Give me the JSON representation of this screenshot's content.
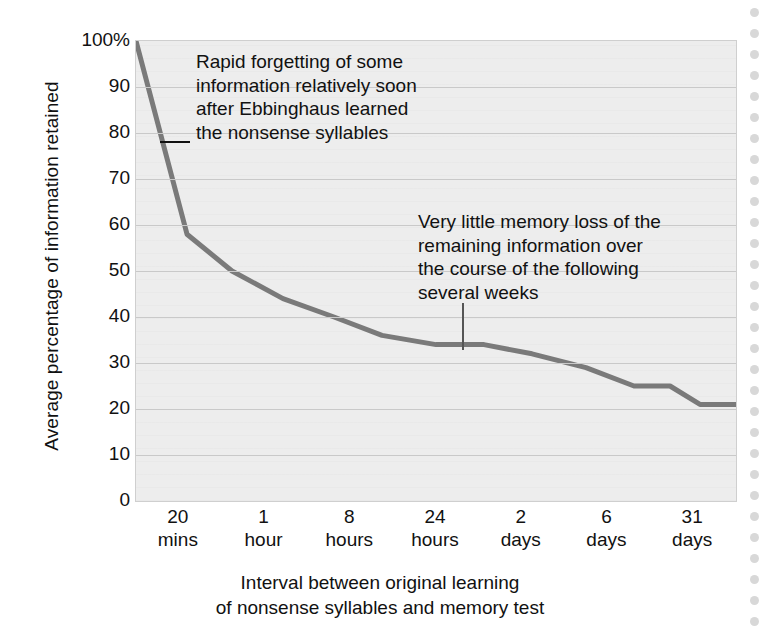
{
  "chart_data": {
    "type": "line",
    "title": "",
    "xlabel": "Interval between original learning of nonsense syllables and memory test",
    "ylabel": "Average percentage of information retained",
    "ylim": [
      0,
      100
    ],
    "grid": true,
    "legend": "none",
    "categories": [
      "20 mins",
      "1 hour",
      "8 hours",
      "24 hours",
      "2 days",
      "6 days",
      "31 days"
    ],
    "ytick_labels": [
      "100%",
      "90",
      "80",
      "70",
      "60",
      "50",
      "40",
      "30",
      "20",
      "10",
      "0"
    ],
    "ytick_values": [
      100,
      90,
      80,
      70,
      60,
      50,
      40,
      30,
      20,
      10,
      0
    ],
    "xtick_labels": [
      {
        "value": "20",
        "unit": "mins"
      },
      {
        "value": "1",
        "unit": "hour"
      },
      {
        "value": "8",
        "unit": "hours"
      },
      {
        "value": "24",
        "unit": "hours"
      },
      {
        "value": "2",
        "unit": "days"
      },
      {
        "value": "6",
        "unit": "days"
      },
      {
        "value": "31",
        "unit": "days"
      }
    ],
    "series": [
      {
        "name": "Retention",
        "color": "#7a7a7a",
        "points": [
          {
            "x": 0.0,
            "label": "0 mins",
            "y": 100
          },
          {
            "x": 8.5,
            "label": "20 mins",
            "y": 58
          },
          {
            "x": 16.0,
            "label": "40 mins",
            "y": 50
          },
          {
            "x": 24.5,
            "label": "1 hour",
            "y": 44
          },
          {
            "x": 33.0,
            "label": "3 hours",
            "y": 40
          },
          {
            "x": 41.0,
            "label": "8 hours",
            "y": 36
          },
          {
            "x": 50.0,
            "label": "16 hours",
            "y": 34
          },
          {
            "x": 58.0,
            "label": "24 hours",
            "y": 34
          },
          {
            "x": 66.0,
            "label": "31 hours",
            "y": 32
          },
          {
            "x": 75.0,
            "label": "2 days",
            "y": 29
          },
          {
            "x": 83.0,
            "label": "4 days",
            "y": 25
          },
          {
            "x": 89.0,
            "label": "6 days",
            "y": 25
          },
          {
            "x": 94.0,
            "label": "15 days",
            "y": 21
          },
          {
            "x": 100.0,
            "label": "31 days",
            "y": 21
          }
        ]
      }
    ],
    "annotations": [
      {
        "id": "rapid-forgetting",
        "text": "Rapid forgetting of some\ninformation relatively soon\nafter Ebbinghaus learned\nthe nonsense syllables",
        "leader": "horizontal-dash"
      },
      {
        "id": "little-memory-loss",
        "text": "Very little memory loss of the\nremaining information over\nthe course of the following\nseveral weeks",
        "leader": "vertical-line"
      }
    ]
  },
  "axes": {
    "y_title": "Average percentage of information retained",
    "x_title_line1": "Interval between original learning",
    "x_title_line2": "of nonsense syllables and memory test"
  },
  "colors": {
    "line": "#7a7a7a",
    "plot_background": "#ededed",
    "gridline": "#c9c9c9",
    "text": "#111111",
    "page_background": "#ffffff",
    "border_dot": "#d8d8d8"
  }
}
